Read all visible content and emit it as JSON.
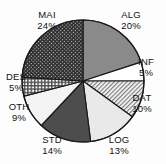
{
  "chart_data": {
    "type": "pie",
    "title": "",
    "subtitle": "",
    "xlabel": "",
    "ylabel": "",
    "legend_position": "none",
    "grid": false,
    "labels_show_percent": true,
    "start_angle_deg": 0,
    "direction": "clockwise",
    "categories": [
      "ALG",
      "INF",
      "DAT",
      "LOG",
      "STD",
      "OTH",
      "DES",
      "MAI"
    ],
    "values": [
      20,
      5,
      10,
      13,
      14,
      9,
      5,
      24
    ],
    "slices": [
      {
        "label": "ALG",
        "percent": 20,
        "percent_text": "20%",
        "fill_style": "solid",
        "color": "#8a8a8a",
        "label_x": 131,
        "label_y": 9
      },
      {
        "label": "INF",
        "percent": 5,
        "percent_text": "5%",
        "fill_style": "solid",
        "color": "#ffffff",
        "label_x": 146,
        "label_y": 56
      },
      {
        "label": "DAT",
        "percent": 10,
        "percent_text": "10%",
        "fill_style": "diagonal-hatch",
        "color": "#9a9a9a",
        "label_x": 142,
        "label_y": 92
      },
      {
        "label": "LOG",
        "percent": 13,
        "percent_text": "13%",
        "fill_style": "solid",
        "color": "#e9e9e9",
        "label_x": 119,
        "label_y": 134
      },
      {
        "label": "STD",
        "percent": 14,
        "percent_text": "14%",
        "fill_style": "solid",
        "color": "#4d4d4d",
        "label_x": 52,
        "label_y": 134
      },
      {
        "label": "OTH",
        "percent": 9,
        "percent_text": "9%",
        "fill_style": "solid",
        "color": "#f3f3f3",
        "label_x": 19,
        "label_y": 101
      },
      {
        "label": "DES",
        "percent": 5,
        "percent_text": "5%",
        "fill_style": "grid-crosshatch",
        "color": "#7e7e7e",
        "label_x": 16,
        "label_y": 71
      },
      {
        "label": "MAI",
        "percent": 24,
        "percent_text": "24%",
        "fill_style": "dense-crosshatch",
        "color": "#3f3f3f",
        "label_x": 47,
        "label_y": 9
      }
    ],
    "geometry": {
      "center_x": 83,
      "center_y": 81,
      "radius": 61,
      "outline_color": "#1a1a1a",
      "outline_width": 1.2
    }
  }
}
